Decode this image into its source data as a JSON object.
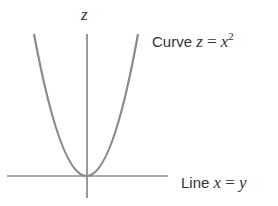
{
  "diagram": {
    "axis_label": "z",
    "curve_label": {
      "prefix": "Curve",
      "lhs": "z",
      "op": "=",
      "rhs": "x",
      "exponent": "2"
    },
    "line_label": {
      "prefix": "Line",
      "lhs": "x",
      "op": "=",
      "rhs": "y"
    },
    "colors": {
      "curve": "#8a8a8a",
      "axes": "#555555",
      "text": "#333333"
    }
  }
}
